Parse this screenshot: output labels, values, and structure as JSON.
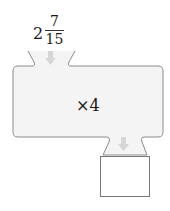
{
  "diagram": {
    "type": "function-machine",
    "input": {
      "whole": "2",
      "numerator": "7",
      "denominator": "15"
    },
    "operation": "×4",
    "output": "",
    "colors": {
      "machine_fill": "#f4f4f4",
      "machine_stroke": "#8c8c8c",
      "arrow": "#d6d6d6"
    }
  }
}
